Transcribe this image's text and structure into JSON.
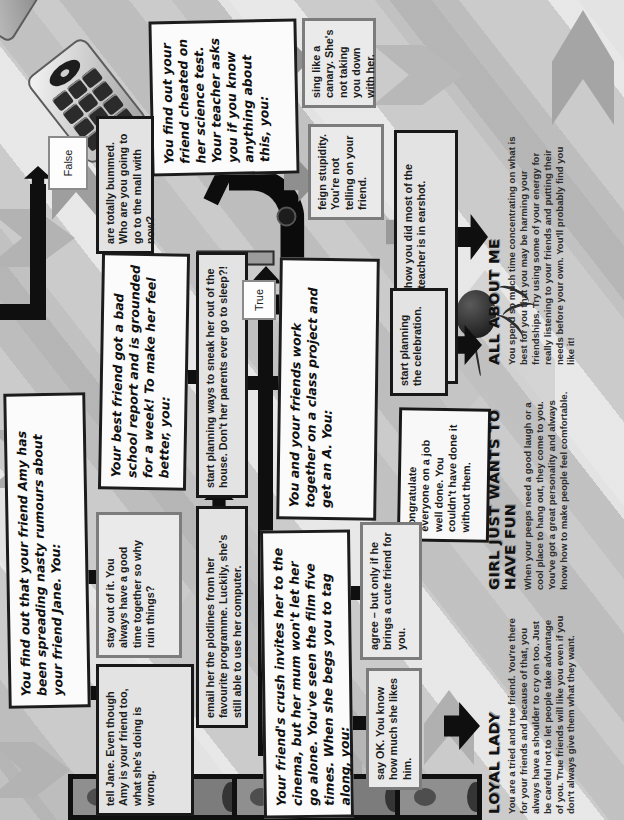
{
  "labels": {
    "true": "True",
    "false": "False"
  },
  "questions": {
    "rumours": "You find out that your friend Amy has been spreading nasty rumours about your friend Jane. You:",
    "grounded": "Your best friend got a bad school report and is grounded for a week! To make her feel better, you:",
    "cheated": "You find out your friend cheated on her science test. Your teacher asks you if you know anything about this, you:",
    "project": "You and your friends work together on a class project and get an A. You:",
    "cinema": "Your friend's crush invites her to the cinema, but her mum won't let her go alone. You've seen the film five times. When she begs you to tag along, you:"
  },
  "answers": {
    "tell_jane": "tell Jane. Even though Amy is your friend too, what she's doing is wrong.",
    "stay_out": "stay out of it. You always have a good time together so why ruin things?",
    "email_plotlines": "email her the plotlines from her favourite programme. Luckily, she's still able to use her computer.",
    "sneak_out": "start planning ways to sneak her out of the house. Don't her parents ever go to sleep?!",
    "bummed": "are totally bummed. Who are you going to go to the mall with now?",
    "sing_canary": "sing like a canary. She's not taking you down with her.",
    "feign_stupidity": "feign stupidity. You're not telling on your friend.",
    "loudly_comment": "loudly comment how you did most of the work when your teacher is in earshot.",
    "celebration": "start planning the celebration.",
    "congratulate": "congratulate everyone on a job well done. You couldn't have done it without them.",
    "agree": "agree – but only if he brings a cute friend for you.",
    "say_ok": "say OK. You know how much she likes him."
  },
  "results": {
    "loyal_lady": {
      "heading": "LOYAL LADY",
      "body": "You are a tried and true friend. You're there for your friends and because of that, you always have a shoulder to cry on too. Just be careful not to let people take advantage of you. True friends will like you even if you don't always give them what they want."
    },
    "girl_fun": {
      "heading": "GIRL JUST WANTS TO HAVE FUN",
      "body": "When your peeps need a good laugh or a cool place to hang out, they come to you. You've got a great personality and always know how to make people feel comfortable."
    },
    "all_about_me": {
      "heading": "ALL ABOUT ME",
      "body": "You spend so much time concentrating on what is best for you that you may be harming your friendships. Try using some of your energy for really listening to your friends and putting their needs before your own. You'll probably find you like it!"
    }
  },
  "colors": {
    "background": "#cbcbcb",
    "question_bg": "#fbfbfb",
    "answer_bg": "#e3e3e3",
    "border_dark": "#1c1c1c",
    "border_gray": "#7c7c7c",
    "arrow_black": "#0f0f0f",
    "arrow_gray": "#a8a8a8"
  }
}
